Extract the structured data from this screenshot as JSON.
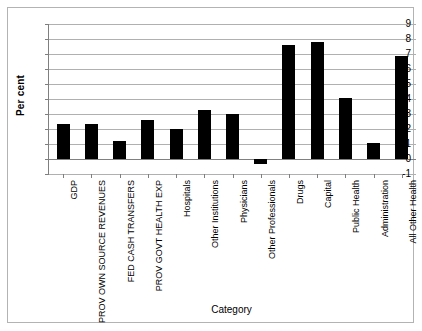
{
  "chart_data": {
    "type": "bar",
    "title": "",
    "xlabel": "Category",
    "ylabel": "Per cent",
    "ylim": [
      -1,
      9
    ],
    "yticks": [
      9,
      8,
      7,
      6,
      5,
      4,
      3,
      2,
      1,
      0,
      -1
    ],
    "grid": true,
    "legend": null,
    "bar_color": "#000000",
    "categories": [
      "GDP",
      "PROV OWN SOURCE REVENUES",
      "FED CASH TRANSFERS",
      "PROV GOVT HEALTH EXP",
      "Hospitals",
      "Other Institutions",
      "Physicians",
      "Other Professionals",
      "Drugs",
      "Capital",
      "Public Health",
      "Administration",
      "All Other Health"
    ],
    "values": [
      2.35,
      2.35,
      1.2,
      2.6,
      2.0,
      3.3,
      3.0,
      -0.3,
      7.6,
      7.8,
      4.1,
      1.1,
      6.9
    ]
  }
}
